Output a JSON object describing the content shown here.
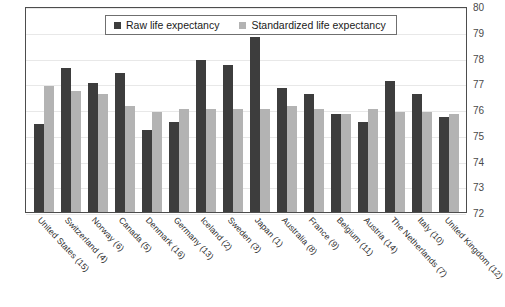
{
  "top_clipped_text": "",
  "legend": {
    "position": "top-center",
    "items": [
      {
        "key": "raw",
        "label": "Raw life expectancy",
        "color": "#3d3d3d"
      },
      {
        "key": "std",
        "label": "Standardized life expectancy",
        "color": "#b3b3b3"
      }
    ]
  },
  "axis": {
    "y_ticks": [
      "80",
      "79",
      "78",
      "77",
      "76",
      "75",
      "74",
      "73",
      "72"
    ],
    "y_position": "right"
  },
  "chart_data": {
    "type": "bar",
    "title": "",
    "xlabel": "",
    "ylabel": "",
    "ylim": [
      72,
      80
    ],
    "yticks": [
      72,
      73,
      74,
      75,
      76,
      77,
      78,
      79,
      80
    ],
    "grid": true,
    "legend_position": "top-center",
    "categories": [
      "United States (15)",
      "Switzerland (4)",
      "Norway (6)",
      "Canada (5)",
      "Denmark (16)",
      "Germany (13)",
      "Iceland (2)",
      "Sweden (3)",
      "Japan (1)",
      "Australia (8)",
      "France (9)",
      "Belgium (11)",
      "Austria (14)",
      "The Netherlands (7)",
      "Italy (10)",
      "United Kingdom (12)"
    ],
    "series": [
      {
        "name": "Raw life expectancy",
        "color": "#3d3d3d",
        "values": [
          75.4,
          77.6,
          77.0,
          77.4,
          75.2,
          75.5,
          77.9,
          77.7,
          78.8,
          76.8,
          76.6,
          75.8,
          75.5,
          77.1,
          76.6,
          75.7
        ]
      },
      {
        "name": "Standardized life expectancy",
        "color": "#b3b3b3",
        "values": [
          76.9,
          76.7,
          76.6,
          76.1,
          75.9,
          76.0,
          76.0,
          76.0,
          76.0,
          76.1,
          76.0,
          75.8,
          76.0,
          75.9,
          75.9,
          75.8
        ]
      }
    ]
  }
}
